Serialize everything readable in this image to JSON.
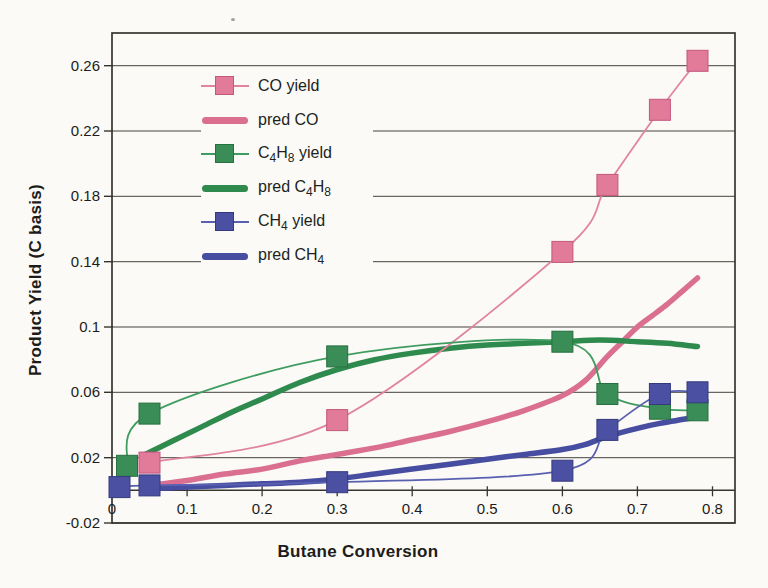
{
  "figure": {
    "background_color": "#fbfaf6",
    "grid_color": "#46433e",
    "frame_color": "#38352f",
    "text_color": "#1d1c1a"
  },
  "chart_data": {
    "type": "scatter",
    "title": "",
    "xlabel": "Butane Conversion",
    "ylabel": "Product Yield (C basis)",
    "xlim": [
      0,
      0.83
    ],
    "ylim": [
      -0.02,
      0.28
    ],
    "grid": "horizontal",
    "legend_position": "inside-upper-left",
    "x_axis_at_zero": true,
    "x_ticks": [
      {
        "v": 0,
        "label": "0"
      },
      {
        "v": 0.1,
        "label": "0.1"
      },
      {
        "v": 0.2,
        "label": "0.2"
      },
      {
        "v": 0.3,
        "label": "0.3"
      },
      {
        "v": 0.4,
        "label": "0.4"
      },
      {
        "v": 0.5,
        "label": "0.5"
      },
      {
        "v": 0.6,
        "label": "0.6"
      },
      {
        "v": 0.7,
        "label": "0.7"
      },
      {
        "v": 0.8,
        "label": "0.8"
      }
    ],
    "y_ticks": [
      {
        "v": 0.26,
        "label": "0.26"
      },
      {
        "v": 0.22,
        "label": "0.22"
      },
      {
        "v": 0.18,
        "label": "0.18"
      },
      {
        "v": 0.14,
        "label": "0.14"
      },
      {
        "v": 0.1,
        "label": "0.1"
      },
      {
        "v": 0.06,
        "label": "0.06"
      },
      {
        "v": 0.02,
        "label": "0.02"
      },
      {
        "v": -0.02,
        "label": "-0.02"
      }
    ],
    "series": [
      {
        "name": "CO yield",
        "slug": "co-yield",
        "kind": "data",
        "legend_parts": [
          {
            "t": "CO yield"
          }
        ],
        "color": "#e084a0",
        "marker_fill": "#e27a99",
        "marker_edge": "#c4577f",
        "points": [
          [
            0.05,
            0.017
          ],
          [
            0.3,
            0.043
          ],
          [
            0.6,
            0.146
          ],
          [
            0.66,
            0.187
          ],
          [
            0.73,
            0.233
          ],
          [
            0.78,
            0.263
          ]
        ]
      },
      {
        "name": "pred CO",
        "slug": "pred-co",
        "kind": "model",
        "legend_parts": [
          {
            "t": "pred CO"
          }
        ],
        "color": "#da6f92",
        "points": [
          [
            0.05,
            0.003
          ],
          [
            0.1,
            0.006
          ],
          [
            0.15,
            0.01
          ],
          [
            0.2,
            0.013
          ],
          [
            0.25,
            0.018
          ],
          [
            0.3,
            0.022
          ],
          [
            0.35,
            0.026
          ],
          [
            0.4,
            0.031
          ],
          [
            0.45,
            0.036
          ],
          [
            0.5,
            0.042
          ],
          [
            0.55,
            0.049
          ],
          [
            0.6,
            0.058
          ],
          [
            0.63,
            0.067
          ],
          [
            0.66,
            0.082
          ],
          [
            0.68,
            0.091
          ],
          [
            0.7,
            0.1
          ],
          [
            0.72,
            0.107
          ],
          [
            0.74,
            0.114
          ],
          [
            0.76,
            0.122
          ],
          [
            0.78,
            0.13
          ]
        ]
      },
      {
        "name": "C4H8 yield",
        "slug": "c4h8-yield",
        "kind": "data",
        "legend_parts": [
          {
            "t": "C"
          },
          {
            "t": "4",
            "sub": true
          },
          {
            "t": "H"
          },
          {
            "t": "8",
            "sub": true
          },
          {
            "t": " yield"
          }
        ],
        "color": "#3f9c60",
        "marker_fill": "#3a8d57",
        "marker_edge": "#27703f",
        "points": [
          [
            0.02,
            0.015
          ],
          [
            0.05,
            0.047
          ],
          [
            0.3,
            0.082
          ],
          [
            0.6,
            0.091
          ],
          [
            0.66,
            0.059
          ],
          [
            0.73,
            0.05
          ],
          [
            0.78,
            0.049
          ]
        ]
      },
      {
        "name": "pred C4H8",
        "slug": "pred-c4h8",
        "kind": "model",
        "legend_parts": [
          {
            "t": "pred C"
          },
          {
            "t": "4",
            "sub": true
          },
          {
            "t": "H"
          },
          {
            "t": "8",
            "sub": true
          }
        ],
        "color": "#2e8a4d",
        "points": [
          [
            0.04,
            0.021
          ],
          [
            0.08,
            0.03
          ],
          [
            0.12,
            0.039
          ],
          [
            0.16,
            0.048
          ],
          [
            0.2,
            0.056
          ],
          [
            0.25,
            0.066
          ],
          [
            0.3,
            0.074
          ],
          [
            0.35,
            0.08
          ],
          [
            0.4,
            0.084
          ],
          [
            0.45,
            0.087
          ],
          [
            0.5,
            0.089
          ],
          [
            0.55,
            0.09
          ],
          [
            0.6,
            0.091
          ],
          [
            0.65,
            0.092
          ],
          [
            0.7,
            0.091
          ],
          [
            0.74,
            0.09
          ],
          [
            0.78,
            0.088
          ]
        ]
      },
      {
        "name": "CH4 yield",
        "slug": "ch4-yield",
        "kind": "data",
        "legend_parts": [
          {
            "t": "CH"
          },
          {
            "t": "4",
            "sub": true
          },
          {
            "t": " yield"
          }
        ],
        "color": "#5a60b0",
        "marker_fill": "#4c50a2",
        "marker_edge": "#353a7e",
        "points": [
          [
            0.01,
            0.002
          ],
          [
            0.05,
            0.003
          ],
          [
            0.3,
            0.005
          ],
          [
            0.6,
            0.012
          ],
          [
            0.66,
            0.037
          ],
          [
            0.73,
            0.059
          ],
          [
            0.78,
            0.06
          ]
        ]
      },
      {
        "name": "pred CH4",
        "slug": "pred-ch4",
        "kind": "model",
        "legend_parts": [
          {
            "t": "pred CH"
          },
          {
            "t": "4",
            "sub": true
          }
        ],
        "color": "#474da0",
        "points": [
          [
            0.05,
            0.001
          ],
          [
            0.1,
            0.002
          ],
          [
            0.15,
            0.003
          ],
          [
            0.2,
            0.004
          ],
          [
            0.25,
            0.005
          ],
          [
            0.3,
            0.007
          ],
          [
            0.35,
            0.01
          ],
          [
            0.4,
            0.013
          ],
          [
            0.45,
            0.016
          ],
          [
            0.5,
            0.019
          ],
          [
            0.55,
            0.022
          ],
          [
            0.6,
            0.025
          ],
          [
            0.63,
            0.028
          ],
          [
            0.66,
            0.033
          ],
          [
            0.7,
            0.038
          ],
          [
            0.73,
            0.041
          ],
          [
            0.78,
            0.045
          ]
        ]
      }
    ]
  }
}
